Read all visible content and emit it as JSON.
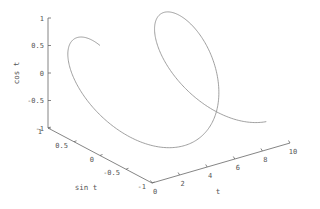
{
  "chart_data": {
    "type": "line3d",
    "title": "",
    "axes": {
      "t": {
        "label": "t",
        "ticks": [
          "0",
          "2",
          "4",
          "6",
          "8",
          "10"
        ],
        "range": [
          0,
          10
        ]
      },
      "sin": {
        "label": "sin t",
        "ticks": [
          "1",
          "0.5",
          "0",
          "-0.5",
          "-1"
        ],
        "range": [
          -1,
          1
        ]
      },
      "cos": {
        "label": "cos t",
        "ticks": [
          "1",
          "0.5",
          "0",
          "-0.5",
          "-1"
        ],
        "range": [
          -1,
          1
        ]
      }
    },
    "series": [
      {
        "name": "helix",
        "x_expr": "t",
        "y_expr": "sin t",
        "z_expr": "cos t",
        "t_range": [
          0,
          10
        ],
        "color": "#888888"
      }
    ],
    "grid": false,
    "legend": null
  },
  "colors": {
    "axis": "#666666",
    "curve": "#8a8a8a",
    "text": "#555555"
  }
}
